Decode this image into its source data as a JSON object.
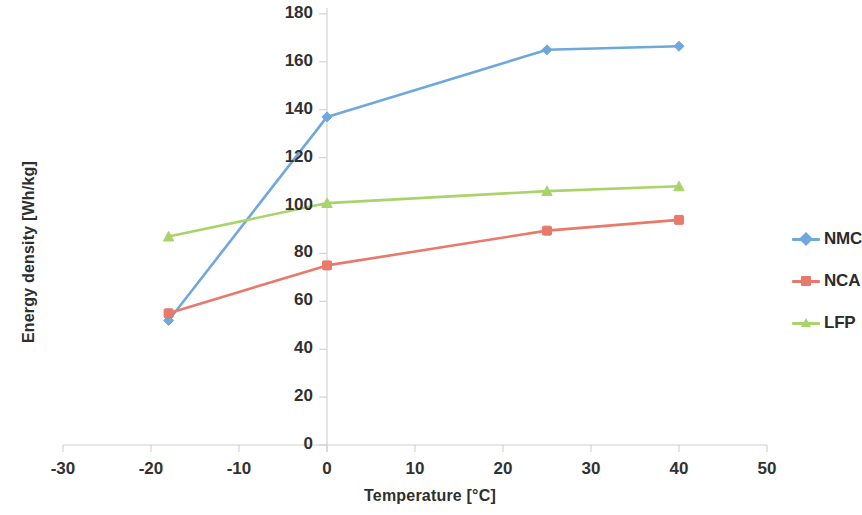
{
  "chart_data": {
    "type": "line",
    "title": "",
    "xlabel": "Temperature [°C]",
    "ylabel": "Energy density [Wh/kg]",
    "xlim": [
      -30,
      50
    ],
    "ylim": [
      0,
      180
    ],
    "xticks": [
      -30,
      -20,
      -10,
      0,
      10,
      20,
      30,
      40,
      50
    ],
    "xtick_labels": [
      "-30",
      "-20",
      "-10",
      "0",
      "10",
      "20",
      "30",
      "40",
      "50"
    ],
    "yticks": [
      0,
      20,
      40,
      60,
      80,
      100,
      120,
      140,
      160,
      180
    ],
    "ytick_labels": [
      "0",
      "20",
      "40",
      "60",
      "80",
      "100",
      "120",
      "140",
      "160",
      "180"
    ],
    "grid": false,
    "legend_position": "right",
    "x": [
      -18,
      0,
      25,
      40
    ],
    "series": [
      {
        "name": "NMC",
        "color": "#6FA8DC",
        "marker": "diamond",
        "values": [
          52,
          137,
          165,
          166.5
        ]
      },
      {
        "name": "NCA",
        "color": "#E8796B",
        "marker": "square",
        "values": [
          55,
          75,
          89.5,
          94
        ]
      },
      {
        "name": "LFP",
        "color": "#A9D36B",
        "marker": "triangle",
        "values": [
          87,
          101,
          106,
          108
        ]
      }
    ]
  },
  "axis": {
    "x_title": "Temperature [°C]",
    "y_title": "Energy density [Wh/kg]",
    "axis_line_color": "#d0d0d0"
  },
  "legend": {
    "entries": [
      {
        "label": "NMC",
        "color": "#6FA8DC",
        "marker": "diamond"
      },
      {
        "label": "NCA",
        "color": "#E8796B",
        "marker": "square"
      },
      {
        "label": "LFP",
        "color": "#A9D36B",
        "marker": "triangle"
      }
    ]
  }
}
